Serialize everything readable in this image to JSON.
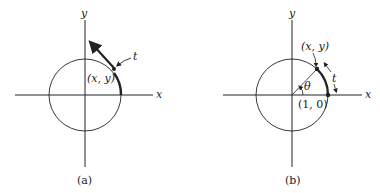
{
  "panels": [
    {
      "id": "a",
      "caption": "(a)",
      "x_axis_label": "x",
      "y_axis_label": "y",
      "point_label": "(x, y)",
      "arc_label": "t"
    },
    {
      "id": "b",
      "caption": "(b)",
      "x_axis_label": "x",
      "y_axis_label": "y",
      "point_label": "(x, y)",
      "arc_label": "t",
      "angle_label": "θ",
      "origin_point_label": "(1, 0)"
    }
  ],
  "colors": {
    "stroke": "#222222",
    "background": "#ffffff"
  }
}
